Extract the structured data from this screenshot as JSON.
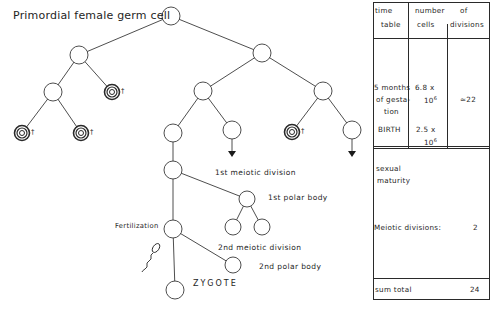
{
  "title": "Primordial female germ cell",
  "labels": {
    "first_meiotic": "1st meiotic division",
    "first_polar": "1st polar body",
    "second_meiotic": "2nd meiotic division",
    "second_polar": "2nd polar body",
    "fertilization": "Fertilization",
    "zygote": "ZYGOTE",
    "dead_mark": "†"
  },
  "table": {
    "header": {
      "col1_line1": "time",
      "col1_line2": "table",
      "col2_line1": "number",
      "col2_line2": "cells",
      "col3_line1": "of",
      "col3_line2": "divisions"
    },
    "rows": [
      {
        "time_line1": "5 months",
        "time_line2": "of gesta-",
        "time_line3": "tion",
        "cells_mantissa": "6.8 x",
        "cells_base": "10",
        "cells_exp": "6"
      },
      {
        "time": "BIRTH",
        "cells_mantissa": "2.5 x",
        "cells_base": "10",
        "cells_exp": "6"
      }
    ],
    "divisions_estimate": "≈22",
    "maturity_line1": "sexual",
    "maturity_line2": "maturity",
    "meiotic_label": "Meiotic divisions:",
    "meiotic_value": "2",
    "sum_label": "sum total",
    "sum_value": "24"
  },
  "colors": {
    "line": "#3a3a3a",
    "background": "#ffffff"
  }
}
